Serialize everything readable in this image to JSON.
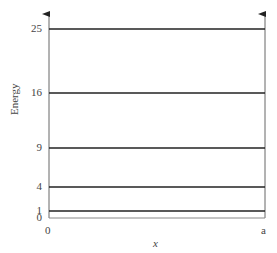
{
  "diagram": {
    "type": "energy_level_diagram",
    "y_axis_label": "Energy",
    "x_axis_label": "x",
    "x_ticks": {
      "left": "0",
      "right": "a"
    },
    "levels": [
      {
        "value": "25",
        "y": 29
      },
      {
        "value": "16",
        "y": 93
      },
      {
        "value": "9",
        "y": 148
      },
      {
        "value": "4",
        "y": 187
      },
      {
        "value": "1",
        "y": 211
      },
      {
        "value": "0",
        "y": 218
      }
    ],
    "colors": {
      "axis": "#666666",
      "level": "#222222"
    }
  }
}
